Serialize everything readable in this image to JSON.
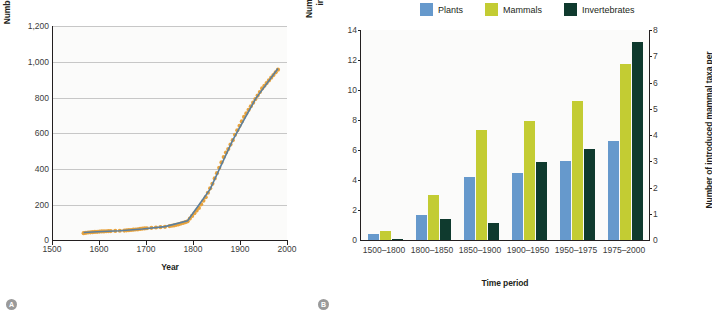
{
  "figure": {
    "panel_a_badge": "A",
    "panel_b_badge": "B"
  },
  "chart_data": [
    {
      "type": "scatter",
      "panel": "A",
      "title": "",
      "xlabel": "Year",
      "ylabel": "Number of non-native species",
      "xlim": [
        1500,
        2020
      ],
      "ylim": [
        0,
        1200
      ],
      "xticks": [
        "1500",
        "1600",
        "1700",
        "1800",
        "1900",
        "2000"
      ],
      "xtick_values": [
        1500,
        1600,
        1700,
        1800,
        1900,
        2000
      ],
      "yticks": [
        "0",
        "200",
        "400",
        "600",
        "800",
        "1,000",
        "1,200"
      ],
      "ytick_values": [
        0,
        200,
        400,
        600,
        800,
        1000,
        1200
      ],
      "grid": "horizontal",
      "legend": "none",
      "series": [
        {
          "name": "Cumulative non-native species (observed)",
          "marker": "circle",
          "color": "#e8a33d",
          "x": [
            1570,
            1575,
            1580,
            1585,
            1590,
            1595,
            1600,
            1605,
            1610,
            1615,
            1620,
            1625,
            1630,
            1640,
            1650,
            1660,
            1665,
            1670,
            1675,
            1680,
            1685,
            1690,
            1695,
            1700,
            1705,
            1710,
            1720,
            1730,
            1740,
            1750,
            1760,
            1765,
            1770,
            1775,
            1780,
            1785,
            1790,
            1795,
            1800,
            1805,
            1810,
            1815,
            1820,
            1825,
            1830,
            1835,
            1840,
            1845,
            1850,
            1855,
            1860,
            1865,
            1870,
            1875,
            1880,
            1885,
            1890,
            1895,
            1900,
            1905,
            1910,
            1915,
            1920,
            1925,
            1930,
            1935,
            1940,
            1945,
            1950,
            1955,
            1960,
            1965,
            1970,
            1975,
            1980,
            1985,
            1990,
            1995,
            2000
          ],
          "y": [
            38,
            40,
            42,
            43,
            44,
            45,
            46,
            47,
            48,
            48,
            49,
            50,
            50,
            51,
            52,
            53,
            54,
            55,
            56,
            58,
            59,
            60,
            62,
            64,
            65,
            66,
            68,
            70,
            72,
            74,
            78,
            80,
            82,
            85,
            88,
            92,
            96,
            100,
            105,
            120,
            135,
            150,
            165,
            180,
            200,
            220,
            240,
            265,
            290,
            315,
            345,
            375,
            405,
            435,
            465,
            490,
            510,
            535,
            560,
            590,
            615,
            640,
            665,
            690,
            710,
            730,
            750,
            770,
            790,
            810,
            830,
            850,
            865,
            880,
            895,
            910,
            925,
            940,
            955
          ]
        },
        {
          "name": "Fitted exponential trend",
          "marker": "line",
          "color": "#5b7f9e",
          "x": [
            1570,
            1600,
            1650,
            1700,
            1750,
            1800,
            1850,
            1900,
            1950,
            2000
          ],
          "y": [
            42,
            46,
            52,
            62,
            75,
            108,
            285,
            560,
            790,
            962
          ]
        }
      ]
    },
    {
      "type": "bar",
      "panel": "B",
      "title": "",
      "xlabel": "Time period",
      "ylabel": "Number of introduced plant and invertebrate taxa per year",
      "ylabel_secondary": "Number of introduced mammal taxa per year",
      "categories": [
        "1500–1800",
        "1800–1850",
        "1850–1900",
        "1900–1950",
        "1950–1975",
        "1975–2000"
      ],
      "ylim": [
        0,
        14
      ],
      "yticks": [
        "0",
        "2",
        "4",
        "6",
        "8",
        "10",
        "12",
        "14"
      ],
      "ytick_values": [
        0,
        2,
        4,
        6,
        8,
        10,
        12,
        14
      ],
      "ylim_secondary": [
        0,
        8
      ],
      "yticks_secondary": [
        "0",
        "1",
        "2",
        "3",
        "4",
        "5",
        "6",
        "7",
        "8"
      ],
      "ytick_values_secondary": [
        0,
        1,
        2,
        3,
        4,
        5,
        6,
        7,
        8
      ],
      "grid": "off",
      "legend_position": "top-center",
      "series": [
        {
          "name": "Plants",
          "color": "#6699cc",
          "axis": "left",
          "values": [
            0.4,
            1.7,
            4.2,
            4.5,
            5.3,
            6.6
          ]
        },
        {
          "name": "Mammals",
          "color": "#c3cc33",
          "axis": "right",
          "values": [
            0.6,
            3.0,
            7.35,
            7.95,
            9.25,
            11.75
          ],
          "values_secondary_scale": [
            0.34,
            1.71,
            4.2,
            4.54,
            5.29,
            6.71
          ]
        },
        {
          "name": "Invertebrates",
          "color": "#0f3a2e",
          "axis": "left",
          "values": [
            0.1,
            1.4,
            1.15,
            5.2,
            6.05,
            13.2
          ]
        }
      ]
    }
  ],
  "panel_a": {
    "ylabel": "Number of non-native species",
    "xlabel": "Year",
    "yticks": [
      "1,200",
      "1,000",
      "800",
      "600",
      "400",
      "200",
      "0"
    ],
    "xticks": [
      "1500",
      "1600",
      "1700",
      "1800",
      "1900",
      "2000"
    ]
  },
  "panel_b": {
    "ylabel_left": "Number of introduced plant and invertebrate taxa per year",
    "ylabel_right": "Number of introduced mammal taxa per year",
    "xlabel": "Time period",
    "yticks_left": [
      "14",
      "12",
      "10",
      "8",
      "6",
      "4",
      "2",
      "0"
    ],
    "yticks_right": [
      "8",
      "7",
      "6",
      "5",
      "4",
      "3",
      "2",
      "1",
      "0"
    ],
    "xticks": [
      "1500–1800",
      "1800–1850",
      "1850–1900",
      "1900–1950",
      "1950–1975",
      "1975–2000"
    ],
    "legend": [
      {
        "label": "Plants",
        "color": "#6699cc"
      },
      {
        "label": "Mammals",
        "color": "#c3cc33"
      },
      {
        "label": "Invertebrates",
        "color": "#0f3a2e"
      }
    ]
  },
  "colors": {
    "plants": "#6699cc",
    "mammals": "#c3cc33",
    "invertebrates": "#0f3a2e",
    "scatter_points": "#e8a33d",
    "trend_line": "#5b7f9e",
    "axis": "#231f20",
    "grid": "#c7c7c7",
    "badge": "#9a9a9a"
  }
}
